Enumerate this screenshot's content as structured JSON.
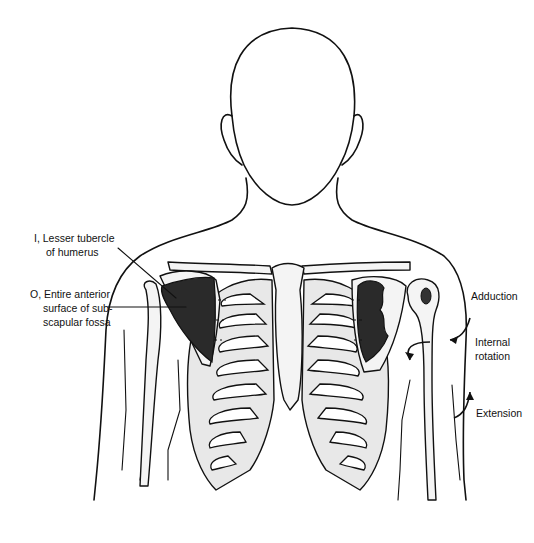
{
  "figure": {
    "colors": {
      "ink": "#111111",
      "muscle": "#2a2a2a",
      "bone_shade": "#e8e8e8",
      "background": "#ffffff"
    }
  },
  "labels": {
    "insertion": {
      "line1": "I, Lesser tubercle",
      "line2": "of humerus"
    },
    "origin": {
      "line1": "O, Entire anterior",
      "line2": "surface of sub-",
      "line3": "scapular fossa"
    }
  },
  "actions": [
    {
      "label_lines": [
        "Adduction"
      ]
    },
    {
      "label_lines": [
        "Internal",
        "rotation"
      ]
    },
    {
      "label_lines": [
        "Extension"
      ]
    }
  ]
}
